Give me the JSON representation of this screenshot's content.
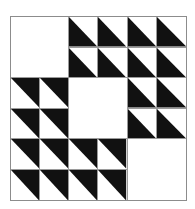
{
  "figure": {
    "type": "quilt-block-pattern",
    "rows": 6,
    "cols": 6,
    "colors": {
      "fill": "#111111",
      "background": "#ffffff",
      "grid_line": "#9a9a9a",
      "border": "#8c8c8c"
    },
    "legend": {
      "bl": "black triangle in lower-left half (diagonal top-left to bottom-right)",
      "tr": "black triangle in upper-right half (diagonal top-left to bottom-right)",
      "blank": "empty white cell"
    },
    "cells": [
      [
        "blank",
        "blank",
        "bl",
        "bl",
        "bl",
        "bl"
      ],
      [
        "blank",
        "blank",
        "bl",
        "bl",
        "bl",
        "bl"
      ],
      [
        "tr",
        "tr",
        "blank",
        "blank",
        "bl",
        "bl"
      ],
      [
        "tr",
        "tr",
        "blank",
        "blank",
        "bl",
        "bl"
      ],
      [
        "tr",
        "tr",
        "tr",
        "tr",
        "blank",
        "blank"
      ],
      [
        "tr",
        "tr",
        "tr",
        "tr",
        "blank",
        "blank"
      ]
    ],
    "blank_blocks": [
      {
        "name": "top-left-blank",
        "row": 0,
        "col": 0,
        "span": 2
      },
      {
        "name": "center-blank",
        "row": 2,
        "col": 2,
        "span": 2
      },
      {
        "name": "bottom-right-blank",
        "row": 4,
        "col": 4,
        "span": 2
      }
    ]
  }
}
